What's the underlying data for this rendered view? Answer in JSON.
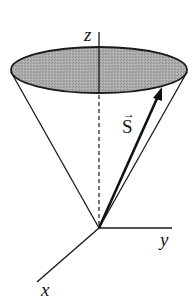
{
  "diagram": {
    "labels": {
      "z_axis": "z",
      "x_axis": "x",
      "y_axis": "y",
      "vector": "S",
      "vector_arrow": "→"
    },
    "colors": {
      "line": "#1a1a1a",
      "ellipse_fill": "#a9a9a9",
      "background": "#ffffff"
    },
    "elements": [
      "cone with shaded elliptical top",
      "z axis (solid above disc, dashed inside cone)",
      "x axis",
      "y axis",
      "vector S from apex to rim"
    ]
  }
}
